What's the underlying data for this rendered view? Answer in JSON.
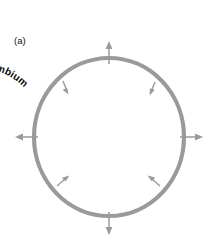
{
  "figure": {
    "panel_label": "(a)",
    "colors": {
      "ring": "#9a9a9a",
      "text": "#0d0d0d",
      "background": "#ffffff",
      "arrow": "#9a9a9a"
    },
    "outer_ring": {
      "name": "secondary-phloem-annotation",
      "full_text": "Secondary phloem being pushed out from the cambium",
      "words": [
        "Secondary",
        "phloem",
        "being",
        "pushed",
        "out",
        "from",
        "the",
        "cambium"
      ]
    },
    "inner_ring": {
      "name": "secondary-xylem-annotation",
      "full_text": "Secondary xylem being laid down inside the cambium",
      "words": [
        "Secondary",
        "xylem",
        "being",
        "laid",
        "down",
        "inside",
        "the",
        "cambium"
      ]
    },
    "second_inner_label": "Secondary",
    "arrows": {
      "cardinal": [
        {
          "name": "arrow-up",
          "direction": "up"
        },
        {
          "name": "arrow-right",
          "direction": "right"
        },
        {
          "name": "arrow-down",
          "direction": "down"
        },
        {
          "name": "arrow-left",
          "direction": "left"
        }
      ],
      "ring_ticks": [
        {
          "name": "tick-arrow-upper-left"
        },
        {
          "name": "tick-arrow-upper-right"
        },
        {
          "name": "tick-arrow-lower-left"
        },
        {
          "name": "tick-arrow-lower-right"
        }
      ]
    }
  }
}
